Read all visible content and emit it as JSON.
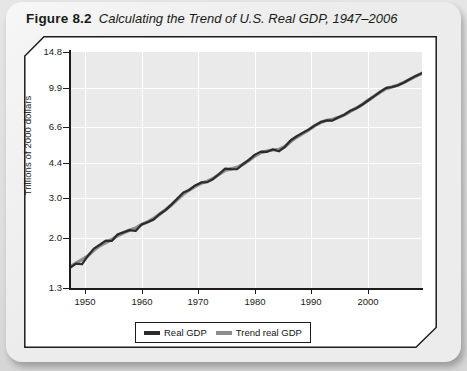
{
  "figure": {
    "number": "Figure 8.2",
    "caption": "Calculating the Trend of U.S. Real GDP, 1947–2006"
  },
  "chart_data": {
    "type": "line",
    "title": "Calculating the Trend of U.S. Real GDP, 1947–2006",
    "xlabel": "",
    "ylabel": "Trillions of 2000 dollars",
    "yscale": "log",
    "grid": true,
    "legend_position": "bottom-center",
    "xlim": [
      1947,
      2006
    ],
    "ylim": [
      1.3,
      14.8
    ],
    "xticks": [
      1950,
      1960,
      1970,
      1980,
      1990,
      2000
    ],
    "yticks": [
      1.3,
      2.0,
      3.0,
      4.4,
      6.6,
      9.9,
      14.8
    ],
    "ytick_labels": [
      "1.3",
      "2.0",
      "3.0",
      "4.4",
      "6.6",
      "9.9",
      "14.8"
    ],
    "xtick_labels": [
      "1950",
      "1960",
      "1970",
      "1980",
      "1990",
      "2000"
    ],
    "x": [
      1947,
      1948,
      1949,
      1950,
      1951,
      1952,
      1953,
      1954,
      1955,
      1956,
      1957,
      1958,
      1959,
      1960,
      1961,
      1962,
      1963,
      1964,
      1965,
      1966,
      1967,
      1968,
      1969,
      1970,
      1971,
      1972,
      1973,
      1974,
      1975,
      1976,
      1977,
      1978,
      1979,
      1980,
      1981,
      1982,
      1983,
      1984,
      1985,
      1986,
      1987,
      1988,
      1989,
      1990,
      1991,
      1992,
      1993,
      1994,
      1995,
      1996,
      1997,
      1998,
      1999,
      2000,
      2001,
      2002,
      2003,
      2004,
      2005,
      2006
    ],
    "series": [
      {
        "name": "Real GDP",
        "color": "#2b2b2b",
        "values": [
          1.6,
          1.67,
          1.66,
          1.81,
          1.95,
          2.03,
          2.12,
          2.11,
          2.26,
          2.31,
          2.36,
          2.34,
          2.5,
          2.56,
          2.63,
          2.78,
          2.9,
          3.07,
          3.27,
          3.48,
          3.57,
          3.74,
          3.86,
          3.87,
          4.0,
          4.21,
          4.45,
          4.43,
          4.42,
          4.66,
          4.87,
          5.14,
          5.3,
          5.29,
          5.42,
          5.32,
          5.56,
          5.96,
          6.21,
          6.43,
          6.65,
          6.93,
          7.18,
          7.31,
          7.3,
          7.55,
          7.76,
          8.08,
          8.29,
          8.61,
          9.0,
          9.39,
          9.82,
          10.22,
          10.32,
          10.5,
          10.81,
          11.21,
          11.57,
          11.9
        ]
      },
      {
        "name": "Trend real GDP",
        "color": "#8d8d8d",
        "values": [
          1.62,
          1.68,
          1.74,
          1.81,
          1.92,
          2.01,
          2.08,
          2.14,
          2.23,
          2.3,
          2.36,
          2.41,
          2.5,
          2.57,
          2.66,
          2.78,
          2.91,
          3.06,
          3.24,
          3.42,
          3.57,
          3.71,
          3.83,
          3.9,
          4.02,
          4.19,
          4.37,
          4.44,
          4.5,
          4.65,
          4.85,
          5.07,
          5.25,
          5.33,
          5.4,
          5.42,
          5.58,
          5.89,
          6.15,
          6.39,
          6.63,
          6.92,
          7.16,
          7.31,
          7.39,
          7.54,
          7.75,
          8.03,
          8.3,
          8.62,
          9.0,
          9.39,
          9.8,
          10.15,
          10.32,
          10.53,
          10.83,
          11.19,
          11.55,
          11.88
        ]
      }
    ]
  },
  "legend": {
    "items": [
      {
        "label": "Real GDP",
        "color": "#2b2b2b"
      },
      {
        "label": "Trend real GDP",
        "color": "#8d8d8d"
      }
    ]
  },
  "colors": {
    "page_background": "#dedede",
    "card_background": "#ececec",
    "panel_background": "#ffffff",
    "plot_background": "#eaeaea",
    "gridline": "#ffffff",
    "axis": "#1c1c1c",
    "real_gdp": "#2b2b2b",
    "trend_gdp": "#8d8d8d"
  }
}
